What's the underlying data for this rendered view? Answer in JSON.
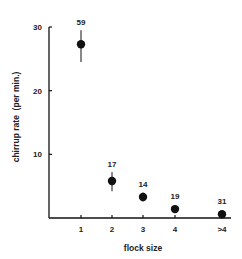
{
  "chart_data": {
    "type": "scatter",
    "title": "",
    "xlabel": "flock size",
    "ylabel": "chirrup rate  (per min.)",
    "categories": [
      "1",
      "2",
      "3",
      "4",
      ">4"
    ],
    "values": [
      27.3,
      5.8,
      3.3,
      1.4,
      0.6
    ],
    "error_low": [
      24.5,
      4.2,
      2.6,
      1.0,
      0.3
    ],
    "error_high": [
      29.5,
      7.2,
      4.0,
      1.8,
      0.9
    ],
    "sample_sizes": [
      "59",
      "17",
      "14",
      "19",
      "31"
    ],
    "yticks": [
      10,
      20,
      30
    ],
    "ylim": [
      0,
      30
    ],
    "grid": false,
    "legend": null,
    "marker": "filled-circle",
    "color": "#111111"
  }
}
